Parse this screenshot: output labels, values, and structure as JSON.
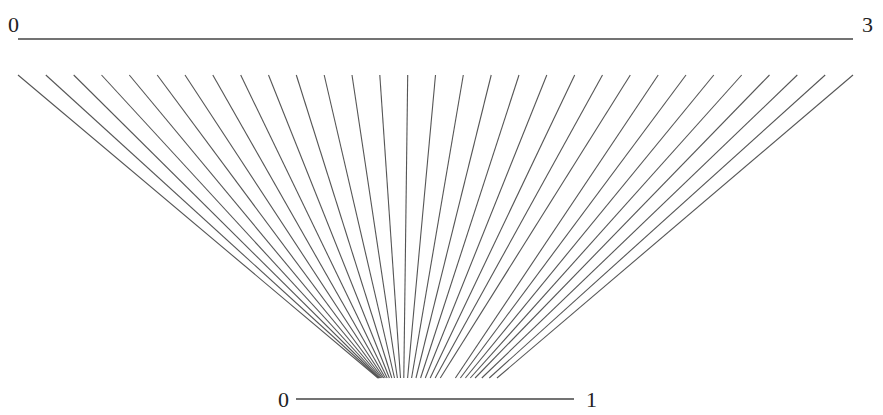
{
  "diagram": {
    "type": "mapping-diagram",
    "colors": {
      "lines": "#555555",
      "axes": "#444444",
      "labels": "#222222",
      "background": "#ffffff"
    },
    "top_axis": {
      "start_label": "0",
      "end_label": "3",
      "min": 0,
      "max": 3,
      "px": {
        "x1": 18,
        "x2": 853,
        "y": 39
      }
    },
    "bottom_axis": {
      "start_label": "0",
      "end_label": "1",
      "min": 0,
      "max": 1,
      "px": {
        "x1": 296,
        "x2": 574,
        "y": 399
      }
    },
    "rays": {
      "count": 31,
      "top_y": 75,
      "bottom_y": 378,
      "top_x": [
        18,
        45.8,
        73.7,
        101.5,
        129.3,
        157.2,
        185,
        212.8,
        240.7,
        268.5,
        296.3,
        324.2,
        352,
        379.8,
        407.7,
        435.5,
        463.3,
        491.2,
        519,
        546.8,
        574.7,
        602.5,
        630.3,
        658.2,
        686,
        713.8,
        741.7,
        769.5,
        797.3,
        825.2,
        853
      ],
      "bottom_x": [
        378,
        378.6,
        379.3,
        380.1,
        381.1,
        382.3,
        383.7,
        385.3,
        387.2,
        389.4,
        391.8,
        394.5,
        397.4,
        400.5,
        403.8,
        407.6,
        411.6,
        416,
        420.6,
        425.3,
        430.2,
        435.2,
        440.3,
        455.4,
        460.4,
        465.4,
        470.3,
        475.1,
        481.8,
        489.3,
        497
      ]
    }
  }
}
